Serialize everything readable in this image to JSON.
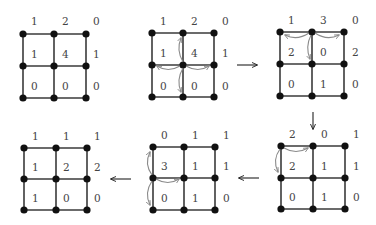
{
  "diagram": {
    "title": "",
    "colors": {
      "edge": "#3a3a3a",
      "node": "#111111",
      "label": "#444444",
      "firing_arrow": "#8a8a8a",
      "step_arrow": "#222222"
    },
    "grids": [
      {
        "id": "g1",
        "nodes_x": [
          23,
          54,
          86
        ],
        "nodes_y": [
          34,
          66,
          98
        ],
        "values": [
          [
            "1",
            "2",
            "0"
          ],
          [
            "1",
            "4",
            "1"
          ],
          [
            "0",
            "0",
            "0"
          ]
        ],
        "firing": null
      },
      {
        "id": "g2",
        "nodes_x": [
          152,
          183,
          214
        ],
        "nodes_y": [
          33,
          65,
          97
        ],
        "values": [
          [
            "1",
            "2",
            "0"
          ],
          [
            "1",
            "4",
            "1"
          ],
          [
            "0",
            "0",
            "0"
          ]
        ],
        "firing": {
          "from": [
            1,
            1
          ],
          "to": [
            [
              0,
              1
            ],
            [
              1,
              0
            ],
            [
              1,
              2
            ],
            [
              2,
              1
            ]
          ]
        }
      },
      {
        "id": "g3",
        "nodes_x": [
          280,
          312,
          344
        ],
        "nodes_y": [
          32,
          64,
          96
        ],
        "values": [
          [
            "1",
            "3",
            "0"
          ],
          [
            "2",
            "0",
            "2"
          ],
          [
            "0",
            "1",
            "0"
          ]
        ],
        "firing": {
          "from": [
            0,
            1
          ],
          "to": [
            [
              0,
              0
            ],
            [
              0,
              2
            ],
            [
              1,
              1
            ]
          ]
        }
      },
      {
        "id": "g4",
        "nodes_x": [
          281,
          313,
          345
        ],
        "nodes_y": [
          146,
          178,
          209
        ],
        "values": [
          [
            "2",
            "0",
            "1"
          ],
          [
            "2",
            "1",
            "1"
          ],
          [
            "0",
            "1",
            "0"
          ]
        ],
        "firing": {
          "from": [
            0,
            0
          ],
          "to": [
            [
              0,
              1
            ],
            [
              1,
              0
            ]
          ]
        }
      },
      {
        "id": "g5",
        "nodes_x": [
          153,
          184,
          215
        ],
        "nodes_y": [
          147,
          178,
          210
        ],
        "values": [
          [
            "0",
            "1",
            "1"
          ],
          [
            "3",
            "1",
            "1"
          ],
          [
            "0",
            "1",
            "0"
          ]
        ],
        "firing": {
          "from": [
            1,
            0
          ],
          "to": [
            [
              0,
              0
            ],
            [
              1,
              1
            ],
            [
              2,
              0
            ]
          ]
        }
      },
      {
        "id": "g6",
        "nodes_x": [
          24,
          56,
          87
        ],
        "nodes_y": [
          148,
          179,
          210
        ],
        "values": [
          [
            "1",
            "1",
            "1"
          ],
          [
            "1",
            "2",
            "2"
          ],
          [
            "1",
            "0",
            "0"
          ]
        ],
        "firing": null
      }
    ],
    "step_arrows": [
      {
        "id": "g2-to-g3",
        "direction": "right",
        "glyph": "→"
      },
      {
        "id": "g3-to-g4",
        "direction": "down",
        "glyph": "↓"
      },
      {
        "id": "g4-to-g5",
        "direction": "left",
        "glyph": "←"
      },
      {
        "id": "g5-to-g6",
        "direction": "left",
        "glyph": "←"
      }
    ]
  }
}
